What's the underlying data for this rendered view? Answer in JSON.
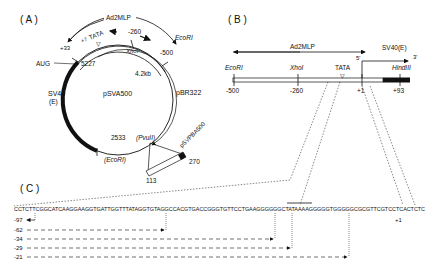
{
  "panel_a": {
    "label": "( A )",
    "plasmid_name": "pSVA500",
    "size": "4.2kb",
    "promoter": "Ad2MLP",
    "pbr": "pBR322",
    "sv40": "SV40",
    "sv40_e": "(E)",
    "aug": "AUG",
    "tata": "TATA",
    "plus7": "+7",
    "plus33": "+33",
    "m260": "-260",
    "m500": "-500",
    "xhoi": "XhoI",
    "ecori_top": "EcoRI",
    "ecori_bottom": "(EcoRI)",
    "pvuii": "(PvuII)",
    "n5227": "5227",
    "n2533": "2533",
    "insert_name": "pSVPBA500",
    "n270": "270",
    "n113": "113"
  },
  "panel_b": {
    "label": "( B )",
    "promoter": "Ad2MLP",
    "sv40": "SV40(E)",
    "five": "5'",
    "three": "3'",
    "ecori": "EcoRI",
    "xhoi": "XhoI",
    "tata": "TATA",
    "hindiii": "HindIII",
    "ticks": [
      "-500",
      "-260",
      "+1",
      "+93"
    ]
  },
  "panel_c": {
    "label": "( C )",
    "sequence": "CCTCTTCGGCATCAAGGAAGGTGATTGGTTTATAGGTGTAGGCCACGTGACCGGGTGTTCCTGAAGGGGGGCTATAAAAGGGGGTGGGGGCGCGTTCGTCCTCACTCTC",
    "plus1": "+1",
    "deletions": [
      "-97",
      "-62",
      "-34",
      "-29",
      "-21"
    ]
  }
}
